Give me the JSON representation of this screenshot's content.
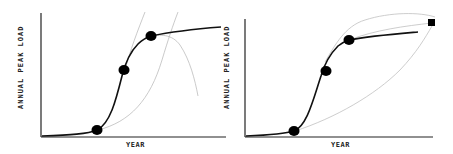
{
  "panels": [
    {
      "id": "left",
      "ylabel": "ANNUAL PEAK LOAD",
      "xlabel": "YEAR",
      "main_curve": "S-curve with three circle markers (low, mid, upper)",
      "comparison_curves": [
        "steep gray extrapolation upward",
        "delayed gray S-curve",
        "gray peaked curve declining"
      ]
    },
    {
      "id": "right",
      "ylabel": "ANNUAL PEAK LOAD",
      "xlabel": "YEAR",
      "main_curve": "S-curve with three circle markers",
      "comparison_curves": [
        "upper gray envelope curve",
        "gray curve to square marker",
        "lower gray convex curve to square marker"
      ],
      "end_marker": "square"
    }
  ],
  "colors": {
    "axis": "#222222",
    "main_curve": "#111111",
    "comparison_curve": "#b8b8b8",
    "marker": "#000000"
  }
}
